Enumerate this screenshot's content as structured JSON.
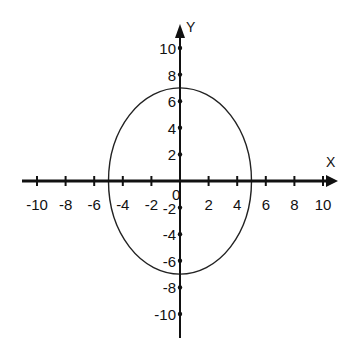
{
  "chart_data": {
    "type": "line",
    "title": "",
    "xlabel": "X",
    "ylabel": "Y",
    "xlim": [
      -10,
      10
    ],
    "ylim": [
      -10,
      10
    ],
    "grid": false,
    "x_ticks": [
      "-10",
      "-8",
      "-6",
      "-4",
      "-2",
      "2",
      "4",
      "6",
      "8",
      "10"
    ],
    "y_ticks": [
      "10",
      "8",
      "6",
      "4",
      "2",
      "-2",
      "-4",
      "-6",
      "-8",
      "-10"
    ],
    "origin_label": "0",
    "series": [
      {
        "name": "ellipse",
        "shape": "ellipse",
        "center": [
          0,
          0
        ],
        "x_radius": 5,
        "y_radius": 7,
        "points": [
          [
            5,
            0
          ],
          [
            0,
            7
          ],
          [
            -5,
            0
          ],
          [
            0,
            -7
          ]
        ]
      }
    ]
  }
}
